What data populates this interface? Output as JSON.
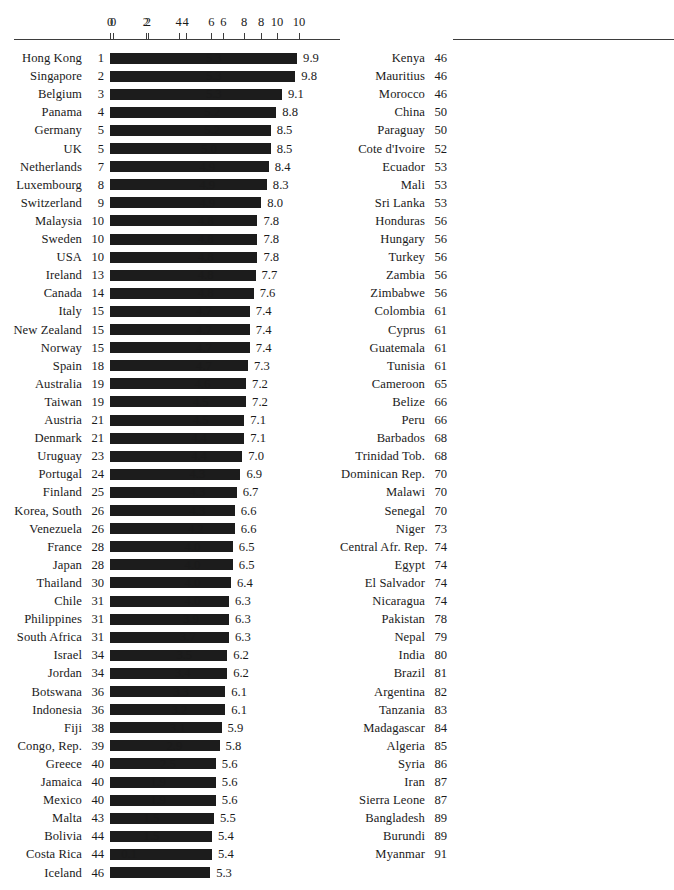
{
  "chart_data": {
    "type": "bar",
    "title": "",
    "xlabel": "",
    "ylabel": "",
    "xlim": [
      0,
      10
    ],
    "grid": false,
    "legend": null,
    "orientation": "horizontal",
    "axis_ticks": [
      0,
      2,
      4,
      6,
      8,
      10
    ],
    "axis_tick_labels": [
      "0",
      "2",
      "4",
      "6",
      "8",
      "10"
    ],
    "columns": [
      {
        "id": "left-column",
        "rows": [
          {
            "name": "Hong Kong",
            "rank": "1",
            "value": 9.9,
            "label": "9.9"
          },
          {
            "name": "Singapore",
            "rank": "2",
            "value": 9.8,
            "label": "9.8"
          },
          {
            "name": "Belgium",
            "rank": "3",
            "value": 9.1,
            "label": "9.1"
          },
          {
            "name": "Panama",
            "rank": "4",
            "value": 8.8,
            "label": "8.8"
          },
          {
            "name": "Germany",
            "rank": "5",
            "value": 8.5,
            "label": "8.5"
          },
          {
            "name": "UK",
            "rank": "5",
            "value": 8.5,
            "label": "8.5"
          },
          {
            "name": "Netherlands",
            "rank": "7",
            "value": 8.4,
            "label": "8.4"
          },
          {
            "name": "Luxembourg",
            "rank": "8",
            "value": 8.3,
            "label": "8.3"
          },
          {
            "name": "Switzerland",
            "rank": "9",
            "value": 8.0,
            "label": "8.0"
          },
          {
            "name": "Malaysia",
            "rank": "10",
            "value": 7.8,
            "label": "7.8"
          },
          {
            "name": "Sweden",
            "rank": "10",
            "value": 7.8,
            "label": "7.8"
          },
          {
            "name": "USA",
            "rank": "10",
            "value": 7.8,
            "label": "7.8"
          },
          {
            "name": "Ireland",
            "rank": "13",
            "value": 7.7,
            "label": "7.7"
          },
          {
            "name": "Canada",
            "rank": "14",
            "value": 7.6,
            "label": "7.6"
          },
          {
            "name": "Italy",
            "rank": "15",
            "value": 7.4,
            "label": "7.4"
          },
          {
            "name": "New Zealand",
            "rank": "15",
            "value": 7.4,
            "label": "7.4"
          },
          {
            "name": "Norway",
            "rank": "15",
            "value": 7.4,
            "label": "7.4"
          },
          {
            "name": "Spain",
            "rank": "18",
            "value": 7.3,
            "label": "7.3"
          },
          {
            "name": "Australia",
            "rank": "19",
            "value": 7.2,
            "label": "7.2"
          },
          {
            "name": "Taiwan",
            "rank": "19",
            "value": 7.2,
            "label": "7.2"
          },
          {
            "name": "Austria",
            "rank": "21",
            "value": 7.1,
            "label": "7.1"
          },
          {
            "name": "Denmark",
            "rank": "21",
            "value": 7.1,
            "label": "7.1"
          },
          {
            "name": "Uruguay",
            "rank": "23",
            "value": 7.0,
            "label": "7.0"
          },
          {
            "name": "Portugal",
            "rank": "24",
            "value": 6.9,
            "label": "6.9"
          },
          {
            "name": "Finland",
            "rank": "25",
            "value": 6.7,
            "label": "6.7"
          },
          {
            "name": "Korea, South",
            "rank": "26",
            "value": 6.6,
            "label": "6.6"
          },
          {
            "name": "Venezuela",
            "rank": "26",
            "value": 6.6,
            "label": "6.6"
          },
          {
            "name": "France",
            "rank": "28",
            "value": 6.5,
            "label": "6.5"
          },
          {
            "name": "Japan",
            "rank": "28",
            "value": 6.5,
            "label": "6.5"
          },
          {
            "name": "Thailand",
            "rank": "30",
            "value": 6.4,
            "label": "6.4"
          },
          {
            "name": "Chile",
            "rank": "31",
            "value": 6.3,
            "label": "6.3"
          },
          {
            "name": "Philippines",
            "rank": "31",
            "value": 6.3,
            "label": "6.3"
          },
          {
            "name": "South Africa",
            "rank": "31",
            "value": 6.3,
            "label": "6.3"
          },
          {
            "name": "Israel",
            "rank": "34",
            "value": 6.2,
            "label": "6.2"
          },
          {
            "name": "Jordan",
            "rank": "34",
            "value": 6.2,
            "label": "6.2"
          },
          {
            "name": "Botswana",
            "rank": "36",
            "value": 6.1,
            "label": "6.1"
          },
          {
            "name": "Indonesia",
            "rank": "36",
            "value": 6.1,
            "label": "6.1"
          },
          {
            "name": "Fiji",
            "rank": "38",
            "value": 5.9,
            "label": "5.9"
          },
          {
            "name": "Congo, Rep.",
            "rank": "39",
            "value": 5.8,
            "label": "5.8"
          },
          {
            "name": "Greece",
            "rank": "40",
            "value": 5.6,
            "label": "5.6"
          },
          {
            "name": "Jamaica",
            "rank": "40",
            "value": 5.6,
            "label": "5.6"
          },
          {
            "name": "Mexico",
            "rank": "40",
            "value": 5.6,
            "label": "5.6"
          },
          {
            "name": "Malta",
            "rank": "43",
            "value": 5.5,
            "label": "5.5"
          },
          {
            "name": "Bolivia",
            "rank": "44",
            "value": 5.4,
            "label": "5.4"
          },
          {
            "name": "Costa Rica",
            "rank": "44",
            "value": 5.4,
            "label": "5.4"
          },
          {
            "name": "Iceland",
            "rank": "46",
            "value": 5.3,
            "label": "5.3"
          }
        ]
      },
      {
        "id": "right-column",
        "rows": [
          {
            "name": "Kenya",
            "rank": "46",
            "value": 5.3,
            "label": "5.3"
          },
          {
            "name": "Mauritius",
            "rank": "46",
            "value": 5.3,
            "label": "5.3"
          },
          {
            "name": "Morocco",
            "rank": "46",
            "value": 5.3,
            "label": "5.3"
          },
          {
            "name": "China",
            "rank": "50",
            "value": 5.2,
            "label": "5.2"
          },
          {
            "name": "Paraguay",
            "rank": "50",
            "value": 5.2,
            "label": "5.2"
          },
          {
            "name": "Cote d'Ivoire",
            "rank": "52",
            "value": 5.0,
            "label": "5.0"
          },
          {
            "name": "Ecuador",
            "rank": "53",
            "value": 4.9,
            "label": "4.9"
          },
          {
            "name": "Mali",
            "rank": "53",
            "value": 4.9,
            "label": "4.9"
          },
          {
            "name": "Sri Lanka",
            "rank": "53",
            "value": 4.9,
            "label": "4.9"
          },
          {
            "name": "Honduras",
            "rank": "56",
            "value": 4.8,
            "label": "4.8"
          },
          {
            "name": "Hungary",
            "rank": "56",
            "value": 4.8,
            "label": "4.8"
          },
          {
            "name": "Turkey",
            "rank": "56",
            "value": 4.8,
            "label": "4.8"
          },
          {
            "name": "Zambia",
            "rank": "56",
            "value": 4.8,
            "label": "4.8"
          },
          {
            "name": "Zimbabwe",
            "rank": "56",
            "value": 4.8,
            "label": "4.8"
          },
          {
            "name": "Colombia",
            "rank": "61",
            "value": 4.7,
            "label": "4.7"
          },
          {
            "name": "Cyprus",
            "rank": "61",
            "value": 4.7,
            "label": "4.7"
          },
          {
            "name": "Guatemala",
            "rank": "61",
            "value": 4.7,
            "label": "4.7"
          },
          {
            "name": "Tunisia",
            "rank": "61",
            "value": 4.7,
            "label": "4.7"
          },
          {
            "name": "Cameroon",
            "rank": "65",
            "value": 4.6,
            "label": "4.6"
          },
          {
            "name": "Belize",
            "rank": "66",
            "value": 4.5,
            "label": "4.5"
          },
          {
            "name": "Peru",
            "rank": "66",
            "value": 4.5,
            "label": "4.5"
          },
          {
            "name": "Barbados",
            "rank": "68",
            "value": 4.4,
            "label": "4.4"
          },
          {
            "name": "Trinidad Tob.",
            "rank": "68",
            "value": 4.4,
            "label": "4.4"
          },
          {
            "name": "Dominican Rep.",
            "rank": "70",
            "value": 4.3,
            "label": "4.3"
          },
          {
            "name": "Malawi",
            "rank": "70",
            "value": 4.3,
            "label": "4.3"
          },
          {
            "name": "Senegal",
            "rank": "70",
            "value": 4.3,
            "label": "4.3"
          },
          {
            "name": "Niger",
            "rank": "73",
            "value": 4.2,
            "label": "4.2"
          },
          {
            "name": "Central Afr. Rep.",
            "rank": "74",
            "value": 4.0,
            "label": "4.0"
          },
          {
            "name": "Egypt",
            "rank": "74",
            "value": 4.0,
            "label": "4.0"
          },
          {
            "name": "El Salvador",
            "rank": "74",
            "value": 4.0,
            "label": "4.0"
          },
          {
            "name": "Nicaragua",
            "rank": "74",
            "value": 4.0,
            "label": "4.0"
          },
          {
            "name": "Pakistan",
            "rank": "78",
            "value": 3.9,
            "label": "3.9"
          },
          {
            "name": "Nepal",
            "rank": "79",
            "value": 3.7,
            "label": "3.7"
          },
          {
            "name": "India",
            "rank": "80",
            "value": 3.5,
            "label": "3.5"
          },
          {
            "name": "Brazil",
            "rank": "81",
            "value": 3.4,
            "label": "3.4"
          },
          {
            "name": "Argentina",
            "rank": "82",
            "value": 3.3,
            "label": "3.3"
          },
          {
            "name": "Tanzania",
            "rank": "83",
            "value": 3.2,
            "label": "3.2"
          },
          {
            "name": "Madagascar",
            "rank": "84",
            "value": 3.1,
            "label": "3.1"
          },
          {
            "name": "Algeria",
            "rank": "85",
            "value": 2.9,
            "label": "2.9"
          },
          {
            "name": "Syria",
            "rank": "86",
            "value": 2.5,
            "label": "2.5"
          },
          {
            "name": "Iran",
            "rank": "87",
            "value": 1.9,
            "label": "1.9"
          },
          {
            "name": "Sierra Leone",
            "rank": "87",
            "value": 1.9,
            "label": "1.9"
          },
          {
            "name": "Bangladesh",
            "rank": "89",
            "value": 1.5,
            "label": "1.5"
          },
          {
            "name": "Burundi",
            "rank": "89",
            "value": 1.5,
            "label": "1.5"
          },
          {
            "name": "Myanmar",
            "rank": "91",
            "value": 0.1,
            "label": "0.1"
          }
        ]
      }
    ]
  },
  "colors": {
    "bar": "#1c1c1c",
    "axis": "#3d3d3d",
    "text": "#1a1a1a",
    "background": "#ffffff"
  }
}
